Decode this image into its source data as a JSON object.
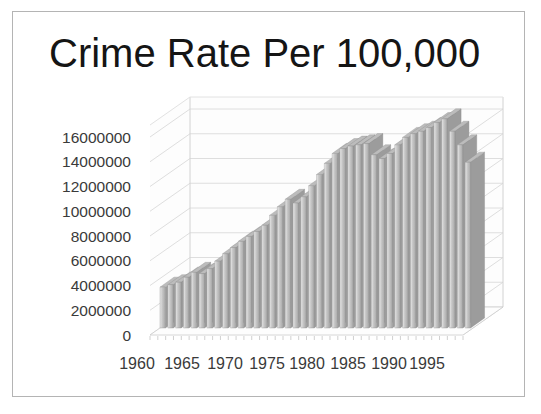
{
  "slide": {
    "title": "Crime Rate Per 100,000"
  },
  "colors": {
    "background": "#ffffff",
    "slide_border": "#b4b4b4",
    "title_text": "#151515",
    "axis_text": "#3a3a3a",
    "gridline": "#dedede",
    "wall_fill": "#fdfdfd",
    "bar_front_light": "#ececec",
    "bar_front_dark": "#a8a8a8",
    "bar_side": "#9c9c9c",
    "bar_top": "#bcbcbc",
    "bar_outline": "#8f8f8f"
  },
  "chart_data": {
    "type": "bar",
    "projection": "3d-column",
    "title": "Crime Rate Per 100,000",
    "xlabel": "",
    "ylabel": "",
    "grid": true,
    "legend": false,
    "ylim": [
      0,
      16000000
    ],
    "y_tick_step": 2000000,
    "y_tick_labels": [
      "0",
      "2000000",
      "4000000",
      "6000000",
      "8000000",
      "10000000",
      "12000000",
      "14000000",
      "16000000"
    ],
    "x_tick_labels": [
      "1960",
      "1965",
      "1970",
      "1975",
      "1980",
      "1985",
      "1990",
      "1995"
    ],
    "x": [
      1960,
      1961,
      1962,
      1963,
      1964,
      1965,
      1966,
      1967,
      1968,
      1969,
      1970,
      1971,
      1972,
      1973,
      1974,
      1975,
      1976,
      1977,
      1978,
      1979,
      1980,
      1981,
      1982,
      1983,
      1984,
      1985,
      1986,
      1987,
      1988,
      1989,
      1990,
      1991,
      1992,
      1993,
      1994,
      1995,
      1996,
      1997,
      1998,
      1999
    ],
    "values": [
      3300000,
      3500000,
      3700000,
      4100000,
      4500000,
      4400000,
      4800000,
      5400000,
      6000000,
      6500000,
      7000000,
      7400000,
      7800000,
      8300000,
      9100000,
      9800000,
      10400000,
      10100000,
      10600000,
      11500000,
      12400000,
      13300000,
      14100000,
      14500000,
      14700000,
      14800000,
      14900000,
      14000000,
      13700000,
      14100000,
      14800000,
      15400000,
      15700000,
      15900000,
      16200000,
      16600000,
      16900000,
      15900000,
      14800000,
      13400000
    ]
  }
}
